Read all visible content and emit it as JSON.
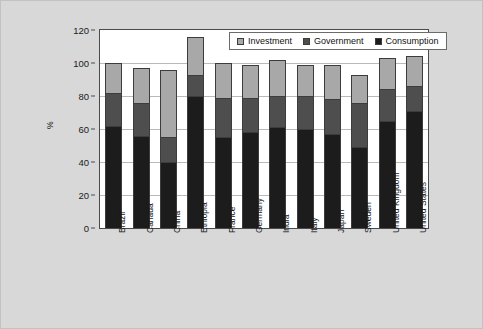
{
  "chart_data": {
    "type": "bar",
    "subtype": "stacked",
    "title": "",
    "xlabel": "",
    "ylabel": "%",
    "ylim": [
      0,
      120
    ],
    "yticks": [
      0,
      20,
      40,
      60,
      80,
      100,
      120
    ],
    "grid": true,
    "legend_position": "top-right",
    "categories": [
      "Brazil",
      "Canada",
      "China",
      "Ethiopia",
      "France",
      "Germany",
      "India",
      "Italy",
      "Japan",
      "Sweden",
      "United Kingdom",
      "United States"
    ],
    "series": [
      {
        "name": "Consumption",
        "color": "#1c1c1c",
        "values": [
          62,
          56,
          40,
          80,
          55,
          58,
          61,
          60,
          57,
          49,
          65,
          71
        ]
      },
      {
        "name": "Government",
        "color": "#4e4e4e",
        "values": [
          20,
          20,
          15,
          13,
          24,
          21,
          19,
          20,
          21,
          27,
          19,
          15
        ]
      },
      {
        "name": "Investment",
        "color": "#a8a8a8",
        "values": [
          18,
          21,
          40.5,
          23,
          21,
          20,
          22,
          19,
          21,
          17,
          19,
          18
        ]
      }
    ],
    "totals": [
      100,
      97,
      95.5,
      116,
      100,
      99,
      102,
      99,
      99,
      93,
      103,
      104
    ],
    "legend": [
      {
        "label": "Investment",
        "color": "#a8a8a8"
      },
      {
        "label": "Government",
        "color": "#4e4e4e"
      },
      {
        "label": "Consumption",
        "color": "#1c1c1c"
      }
    ]
  },
  "colors": {
    "figure_background": "#d8d8d8",
    "plot_background": "#ffffff",
    "axis": "#4a4a4a",
    "gridline": "#b9b9b9",
    "text": "#1a1a1a"
  }
}
